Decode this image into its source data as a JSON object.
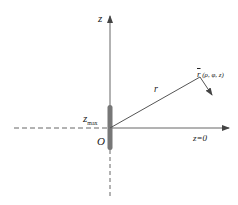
{
  "diagram": {
    "type": "coordinate-axes",
    "labels": {
      "z_axis": "z",
      "r": "r",
      "point_vector": "r",
      "point_coords": "(ρ, φ, z)",
      "zmax_base": "z",
      "zmax_sub": "max",
      "origin": "O",
      "plane": "z=0"
    },
    "colors": {
      "axis": "#555555",
      "bar": "#777777",
      "text": "#222222"
    }
  }
}
